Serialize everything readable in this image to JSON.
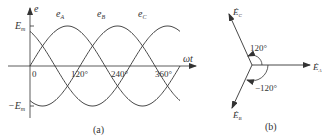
{
  "panel_a": {
    "caption": "(a)",
    "y_axis_label": "e",
    "x_axis_label": "ωt",
    "amplitude_top": "E",
    "amplitude_top_sub": "m",
    "amplitude_bottom": "−E",
    "amplitude_bottom_sub": "m",
    "origin": "0",
    "ticks": [
      "120°",
      "240°",
      "360°"
    ],
    "curves": [
      {
        "name": "e",
        "sub": "A",
        "phase_deg": 0
      },
      {
        "name": "e",
        "sub": "B",
        "phase_deg": -120
      },
      {
        "name": "e",
        "sub": "C",
        "phase_deg": 120
      }
    ]
  },
  "panel_b": {
    "caption": "(b)",
    "phasors": [
      {
        "name": "Ė",
        "sub": "A",
        "angle_deg": 0
      },
      {
        "name": "Ė",
        "sub": "B",
        "angle_deg": -120
      },
      {
        "name": "Ė",
        "sub": "C",
        "angle_deg": 120
      }
    ],
    "angle_labels": [
      "120°",
      "−120°"
    ]
  },
  "colors": {
    "line": "#333333",
    "background": "#ffffff"
  }
}
